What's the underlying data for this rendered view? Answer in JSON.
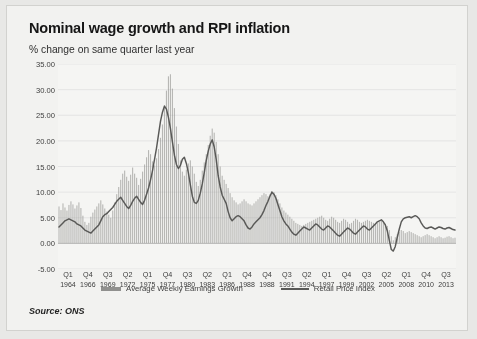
{
  "figure": {
    "title": "Nominal wage growth and RPI inflation",
    "subtitle": "% change on same quarter last year",
    "source": "Source: ONS"
  },
  "legend": {
    "items": [
      {
        "label": "Average Weekly Earnings Growth",
        "marker": "bar",
        "color": "#8f8f8d"
      },
      {
        "label": "Retail Price Index",
        "marker": "line",
        "color": "#575755"
      }
    ]
  },
  "chart_data": {
    "type": "bar",
    "title": "Nominal wage growth and RPI inflation",
    "subtitle": "% change on same quarter last year",
    "xlabel": "",
    "ylabel": "% change on same quarter last year",
    "ylim": [
      -5,
      35
    ],
    "yticks": [
      "35.00",
      "30.00",
      "25.00",
      "20.00",
      "15.00",
      "10.00",
      "5.00",
      "0.00",
      "-5.00"
    ],
    "ytick_values": [
      35,
      30,
      25,
      20,
      15,
      10,
      5,
      0,
      -5
    ],
    "grid": true,
    "legend_position": "bottom",
    "x_tick_labels": [
      {
        "quarter": "Q1",
        "year": "1964"
      },
      {
        "quarter": "Q4",
        "year": "1966"
      },
      {
        "quarter": "Q3",
        "year": "1969"
      },
      {
        "quarter": "Q2",
        "year": "1972"
      },
      {
        "quarter": "Q1",
        "year": "1975"
      },
      {
        "quarter": "Q4",
        "year": "1977"
      },
      {
        "quarter": "Q3",
        "year": "1980"
      },
      {
        "quarter": "Q2",
        "year": "1983"
      },
      {
        "quarter": "Q1",
        "year": "1986"
      },
      {
        "quarter": "Q4",
        "year": "1988"
      },
      {
        "quarter": "Q4",
        "year": "1988"
      },
      {
        "quarter": "Q3",
        "year": "1991"
      },
      {
        "quarter": "Q2",
        "year": "1994"
      },
      {
        "quarter": "Q1",
        "year": "1997"
      },
      {
        "quarter": "Q4",
        "year": "1999"
      },
      {
        "quarter": "Q3",
        "year": "2002"
      },
      {
        "quarter": "Q2",
        "year": "2005"
      },
      {
        "quarter": "Q1",
        "year": "2008"
      },
      {
        "quarter": "Q4",
        "year": "2010"
      },
      {
        "quarter": "Q3",
        "year": "2013"
      }
    ],
    "x_start": "Q1 1964",
    "x_end": "Q3 2013",
    "series": [
      {
        "name": "Average Weekly Earnings Growth",
        "type": "bar",
        "color": "#8f8f8d",
        "values": [
          7.2,
          6.5,
          7.8,
          7.0,
          6.4,
          7.5,
          8.2,
          7.6,
          6.8,
          7.4,
          8.0,
          6.9,
          5.4,
          4.2,
          3.6,
          4.0,
          5.2,
          6.0,
          6.6,
          7.2,
          7.8,
          8.4,
          7.6,
          6.8,
          6.2,
          5.6,
          5.0,
          6.4,
          8.0,
          9.6,
          11.0,
          12.4,
          13.6,
          14.2,
          13.0,
          12.2,
          13.4,
          14.8,
          13.6,
          12.8,
          11.4,
          12.6,
          14.0,
          15.4,
          16.8,
          18.2,
          17.4,
          16.0,
          15.2,
          16.6,
          18.4,
          20.6,
          23.2,
          26.4,
          29.8,
          32.6,
          33.0,
          30.2,
          26.4,
          22.8,
          19.4,
          16.2,
          14.0,
          13.2,
          14.4,
          15.6,
          16.2,
          15.0,
          13.6,
          12.0,
          11.2,
          12.4,
          14.2,
          15.8,
          17.4,
          19.2,
          21.0,
          22.4,
          21.6,
          19.8,
          17.4,
          15.0,
          13.2,
          12.4,
          11.6,
          10.8,
          9.8,
          9.0,
          8.4,
          8.0,
          7.6,
          7.8,
          8.2,
          8.6,
          8.2,
          7.8,
          7.6,
          7.4,
          7.8,
          8.2,
          8.6,
          9.0,
          9.4,
          9.8,
          9.6,
          9.2,
          9.6,
          10.2,
          10.0,
          9.4,
          8.6,
          7.8,
          7.0,
          6.4,
          6.0,
          5.6,
          5.2,
          4.8,
          4.4,
          4.0,
          3.8,
          3.6,
          3.4,
          3.6,
          3.8,
          4.0,
          4.2,
          4.4,
          4.6,
          4.8,
          5.0,
          5.2,
          5.4,
          5.0,
          4.6,
          4.4,
          4.8,
          5.2,
          5.0,
          4.6,
          4.2,
          4.0,
          4.4,
          4.8,
          4.6,
          4.2,
          3.8,
          4.0,
          4.4,
          4.8,
          4.6,
          4.2,
          4.0,
          4.2,
          4.4,
          4.6,
          4.4,
          4.2,
          4.0,
          3.8,
          4.0,
          4.2,
          4.4,
          4.2,
          3.8,
          3.4,
          2.6,
          1.4,
          0.6,
          1.2,
          1.8,
          2.2,
          2.6,
          2.4,
          2.0,
          2.2,
          2.4,
          2.2,
          2.0,
          1.8,
          1.6,
          1.4,
          1.2,
          1.4,
          1.6,
          1.8,
          1.6,
          1.4,
          1.2,
          1.0,
          1.2,
          1.4,
          1.2,
          1.0,
          1.1,
          1.3,
          1.4,
          1.2,
          1.0,
          1.1
        ]
      },
      {
        "name": "Retail Price Index",
        "type": "line",
        "color": "#575755",
        "values": [
          3.2,
          3.6,
          4.0,
          4.4,
          4.6,
          4.8,
          4.6,
          4.4,
          4.2,
          3.8,
          3.6,
          3.4,
          3.0,
          2.6,
          2.4,
          2.2,
          2.0,
          2.4,
          2.8,
          3.2,
          3.6,
          4.4,
          5.2,
          5.6,
          5.8,
          6.2,
          6.6,
          7.0,
          7.6,
          8.2,
          8.6,
          9.0,
          8.4,
          7.8,
          7.2,
          6.8,
          7.4,
          8.2,
          8.8,
          9.2,
          8.6,
          8.0,
          7.6,
          8.4,
          9.6,
          10.8,
          12.4,
          14.2,
          16.4,
          18.6,
          21.2,
          23.8,
          25.6,
          26.8,
          26.2,
          24.6,
          22.4,
          19.8,
          17.2,
          15.4,
          14.6,
          15.2,
          16.4,
          16.8,
          15.6,
          13.8,
          11.4,
          9.2,
          8.0,
          7.8,
          8.4,
          9.8,
          11.6,
          13.8,
          16.2,
          18.0,
          19.4,
          20.2,
          18.8,
          16.4,
          13.2,
          11.0,
          9.4,
          8.6,
          7.8,
          6.2,
          5.0,
          4.4,
          4.8,
          5.2,
          5.4,
          5.2,
          4.8,
          4.4,
          3.6,
          3.0,
          2.8,
          3.2,
          3.8,
          4.2,
          4.6,
          5.0,
          5.6,
          6.4,
          7.4,
          8.2,
          9.2,
          10.0,
          9.6,
          8.8,
          7.6,
          6.4,
          5.2,
          4.4,
          3.8,
          3.4,
          2.8,
          2.2,
          1.8,
          1.6,
          2.0,
          2.4,
          2.8,
          3.2,
          3.0,
          2.8,
          2.6,
          3.0,
          3.4,
          3.8,
          3.6,
          3.2,
          2.8,
          2.6,
          3.0,
          3.4,
          3.2,
          2.8,
          2.4,
          2.0,
          1.6,
          1.4,
          1.8,
          2.2,
          2.6,
          3.0,
          2.8,
          2.4,
          2.0,
          1.8,
          2.2,
          2.6,
          3.0,
          3.4,
          3.2,
          2.8,
          2.6,
          3.0,
          3.4,
          3.8,
          4.2,
          4.4,
          4.6,
          4.2,
          3.6,
          2.4,
          0.6,
          -1.2,
          -1.5,
          -0.6,
          1.2,
          2.8,
          4.2,
          4.8,
          5.0,
          5.1,
          5.2,
          5.0,
          5.2,
          5.4,
          5.2,
          4.8,
          4.0,
          3.4,
          3.0,
          2.9,
          3.1,
          3.2,
          3.0,
          2.8,
          3.0,
          3.2,
          3.1,
          2.9,
          2.8,
          3.0,
          3.1,
          2.9,
          2.7,
          2.6
        ]
      }
    ]
  }
}
